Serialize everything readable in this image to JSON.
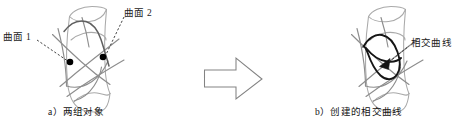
{
  "figure": {
    "width": 463,
    "height": 127,
    "background": "#ffffff"
  },
  "colors": {
    "surface_light": "#a8a8a8",
    "surface_mid": "#8c8c8c",
    "surface_dark": "#6e6e6e",
    "intersection_curve": "#151515",
    "marker_dot": "#000000",
    "leader_dash": "#2b2b2b",
    "arrow_outline": "#7a7a7a",
    "text": "#111111"
  },
  "panel_a": {
    "id": "panel-a",
    "caption": "a）两组对象",
    "annotations": [
      {
        "name": "surface-1",
        "label": "曲面 1",
        "label_x": 3,
        "label_y": 33,
        "dot_x": 70,
        "dot_y": 62
      },
      {
        "name": "surface-2",
        "label": "曲面 2",
        "label_x": 124,
        "label_y": 9,
        "dot_x": 103,
        "dot_y": 57
      }
    ]
  },
  "transition": {
    "name": "right-block-arrow",
    "glyph": "⇨",
    "direction": "right"
  },
  "panel_b": {
    "id": "panel-b",
    "caption": "b）创建的相交曲线",
    "annotations": [
      {
        "name": "intersection-curve",
        "label": "相交曲线",
        "label_x": 411,
        "label_y": 39,
        "tip_x": 382,
        "tip_y": 62
      }
    ]
  }
}
